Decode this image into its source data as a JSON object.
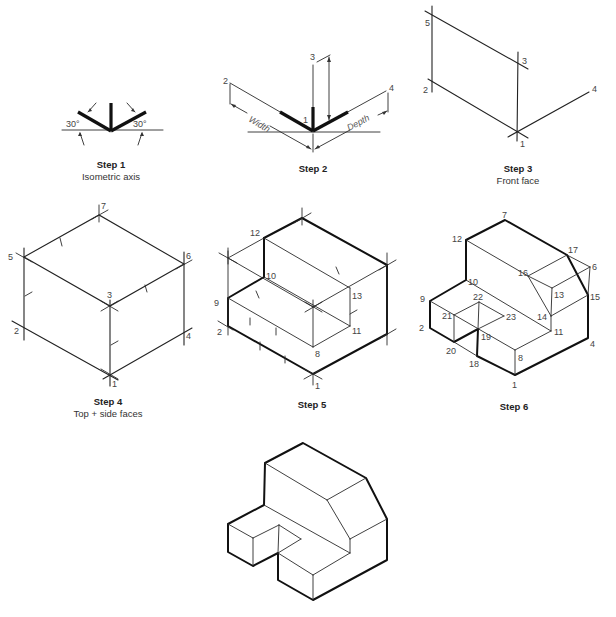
{
  "figure": {
    "steps": [
      {
        "id": "step1",
        "title": "Step 1",
        "subtitle": "Isometric axis",
        "angle_left": "30°",
        "angle_right": "30°"
      },
      {
        "id": "step2",
        "title": "Step 2",
        "width_label": "Width",
        "depth_label": "Depth",
        "points": {
          "p1": "1",
          "p2": "2",
          "p3": "3",
          "p4": "4"
        }
      },
      {
        "id": "step3",
        "title": "Step 3",
        "subtitle": "Front face",
        "points": {
          "p1": "1",
          "p2": "2",
          "p3": "3",
          "p4": "4",
          "p5": "5"
        }
      },
      {
        "id": "step4",
        "title": "Step 4",
        "subtitle": "Top + side faces",
        "points": {
          "p1": "1",
          "p2": "2",
          "p3": "3",
          "p4": "4",
          "p5": "5",
          "p6": "6",
          "p7": "7"
        }
      },
      {
        "id": "step5",
        "title": "Step 5",
        "points": {
          "p1": "1",
          "p2": "2",
          "p8": "8",
          "p9": "9",
          "p10": "10",
          "p11": "11",
          "p12": "12",
          "p13": "13"
        }
      },
      {
        "id": "step6",
        "title": "Step 6",
        "points": {
          "p1": "1",
          "p2": "2",
          "p4": "4",
          "p6": "6",
          "p7": "7",
          "p8": "8",
          "p9": "9",
          "p10": "10",
          "p11": "11",
          "p12": "12",
          "p13": "13",
          "p14": "14",
          "p15": "15",
          "p16": "16",
          "p17": "17",
          "p18": "18",
          "p19": "19",
          "p20": "20",
          "p21": "21",
          "p22": "22",
          "p23": "23"
        }
      },
      {
        "id": "final",
        "title": ""
      }
    ]
  }
}
